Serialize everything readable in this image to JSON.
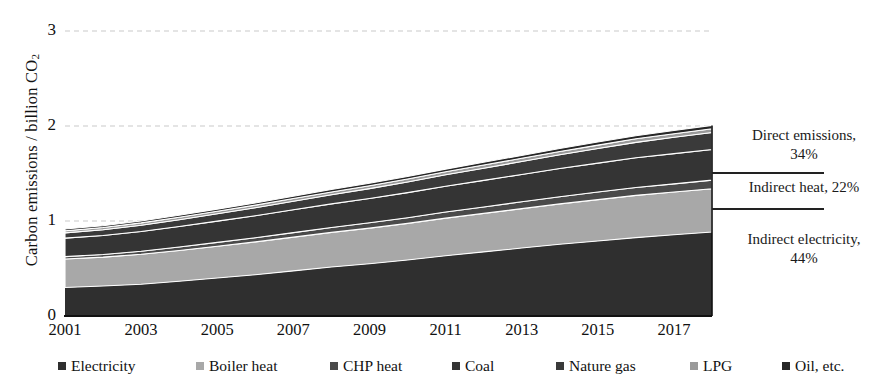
{
  "chart_data": {
    "type": "area",
    "title": "",
    "xlabel": "",
    "ylabel": "Carbon emissions / billion CO2",
    "ylabel_prefix": "Carbon emissions / billion CO",
    "ylabel_sub": "2",
    "ylim": [
      0,
      3
    ],
    "yticks": [
      0,
      1,
      2,
      3
    ],
    "ytick_labels": [
      "0",
      "1",
      "2",
      "3"
    ],
    "grid": true,
    "grid_style": "dashed",
    "legend_position": "bottom",
    "x": [
      2001,
      2002,
      2003,
      2004,
      2005,
      2006,
      2007,
      2008,
      2009,
      2010,
      2011,
      2012,
      2013,
      2014,
      2015,
      2016,
      2017,
      2018
    ],
    "xtick_labels": [
      "2001",
      "2003",
      "2005",
      "2007",
      "2009",
      "2011",
      "2013",
      "2015",
      "2017"
    ],
    "xticks": [
      2001,
      2003,
      2005,
      2007,
      2009,
      2011,
      2013,
      2015,
      2017
    ],
    "stacked": true,
    "series": [
      {
        "name": "Electricity",
        "color": "#2f2f2f",
        "values": [
          0.3,
          0.315,
          0.335,
          0.365,
          0.4,
          0.435,
          0.475,
          0.515,
          0.55,
          0.59,
          0.635,
          0.675,
          0.715,
          0.755,
          0.79,
          0.825,
          0.855,
          0.885
        ]
      },
      {
        "name": "Boiler heat",
        "color": "#a8a8a8",
        "values": [
          0.3,
          0.305,
          0.315,
          0.325,
          0.335,
          0.345,
          0.355,
          0.365,
          0.375,
          0.385,
          0.395,
          0.405,
          0.415,
          0.425,
          0.435,
          0.445,
          0.45,
          0.455
        ]
      },
      {
        "name": "CHP heat",
        "color": "#4a4a4a",
        "values": [
          0.025,
          0.028,
          0.032,
          0.036,
          0.04,
          0.044,
          0.048,
          0.052,
          0.056,
          0.06,
          0.064,
          0.068,
          0.072,
          0.076,
          0.08,
          0.083,
          0.086,
          0.09
        ]
      },
      {
        "name": "Coal",
        "color": "#343434",
        "values": [
          0.195,
          0.2,
          0.208,
          0.216,
          0.224,
          0.232,
          0.24,
          0.248,
          0.256,
          0.264,
          0.272,
          0.28,
          0.288,
          0.296,
          0.304,
          0.312,
          0.318,
          0.322
        ]
      },
      {
        "name": "Nature gas",
        "color": "#3a3a3a",
        "values": [
          0.055,
          0.06,
          0.066,
          0.072,
          0.078,
          0.084,
          0.09,
          0.097,
          0.104,
          0.112,
          0.12,
          0.128,
          0.136,
          0.145,
          0.154,
          0.163,
          0.172,
          0.18
        ]
      },
      {
        "name": "LPG",
        "color": "#9a9a9a",
        "values": [
          0.022,
          0.023,
          0.024,
          0.025,
          0.026,
          0.027,
          0.028,
          0.029,
          0.03,
          0.031,
          0.032,
          0.033,
          0.034,
          0.035,
          0.036,
          0.037,
          0.038,
          0.039
        ]
      },
      {
        "name": "Oil, etc.",
        "color": "#262626",
        "values": [
          0.018,
          0.019,
          0.02,
          0.021,
          0.022,
          0.023,
          0.024,
          0.025,
          0.026,
          0.027,
          0.028,
          0.029,
          0.03,
          0.031,
          0.032,
          0.033,
          0.034,
          0.035
        ]
      }
    ],
    "annotations": [
      {
        "id": "direct",
        "line1": "Direct emissions,",
        "line2": "34%"
      },
      {
        "id": "indirect-heat",
        "line1": "Indirect heat, 22%",
        "line2": ""
      },
      {
        "id": "indirect-electricity",
        "line1": "Indirect electricity,",
        "line2": "44%"
      }
    ]
  },
  "legend": {
    "items": [
      {
        "label": "Electricity",
        "color": "#2f2f2f"
      },
      {
        "label": "Boiler heat",
        "color": "#a8a8a8"
      },
      {
        "label": "CHP heat",
        "color": "#4a4a4a"
      },
      {
        "label": "Coal",
        "color": "#343434"
      },
      {
        "label": "Nature gas",
        "color": "#3a3a3a"
      },
      {
        "label": "LPG",
        "color": "#9a9a9a"
      },
      {
        "label": "Oil, etc.",
        "color": "#262626"
      }
    ]
  }
}
